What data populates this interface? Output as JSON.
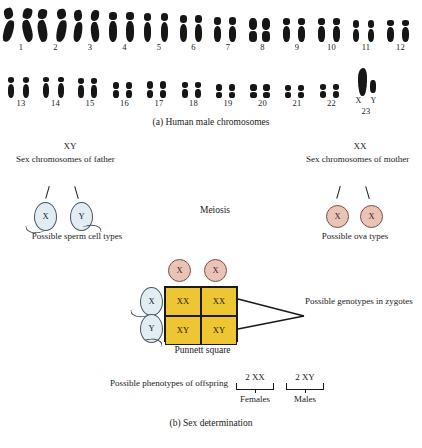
{
  "figure": {
    "caption_a": "(a) Human male chromosomes",
    "caption_b": "(b) Sex determination"
  },
  "karyotype": {
    "row1": [
      {
        "num": "1"
      },
      {
        "num": "2"
      },
      {
        "num": "3"
      },
      {
        "num": "4"
      },
      {
        "num": "5"
      },
      {
        "num": "6"
      },
      {
        "num": "7"
      },
      {
        "num": "8"
      },
      {
        "num": "9"
      },
      {
        "num": "10"
      },
      {
        "num": "11"
      },
      {
        "num": "12"
      }
    ],
    "row2": [
      {
        "num": "13"
      },
      {
        "num": "14"
      },
      {
        "num": "15"
      },
      {
        "num": "16"
      },
      {
        "num": "17"
      },
      {
        "num": "18"
      },
      {
        "num": "19"
      },
      {
        "num": "20"
      },
      {
        "num": "21"
      },
      {
        "num": "22"
      },
      {
        "num": "23"
      }
    ],
    "sex_pair": {
      "x_label": "X",
      "y_label": "Y"
    }
  },
  "father": {
    "genotype": "XY",
    "description": "Sex chromosomes of father",
    "gametes": [
      {
        "label": "X"
      },
      {
        "label": "Y"
      }
    ],
    "gamete_caption": "Possible sperm cell types"
  },
  "mother": {
    "genotype": "XX",
    "description": "Sex chromosomes of mother",
    "gametes": [
      {
        "label": "X"
      },
      {
        "label": "X"
      }
    ],
    "gamete_caption": "Possible ova types"
  },
  "meiosis_label": "Meiosis",
  "punnett": {
    "label": "Punnett square",
    "column_gametes": [
      {
        "label": "X"
      },
      {
        "label": "X"
      }
    ],
    "row_gametes": [
      {
        "label": "X"
      },
      {
        "label": "Y"
      }
    ],
    "cells": [
      {
        "genotype": "XX"
      },
      {
        "genotype": "XX"
      },
      {
        "genotype": "XY"
      },
      {
        "genotype": "XY"
      }
    ],
    "annotation": "Possible genotypes in zygotes",
    "fill_color": "#eec633"
  },
  "phenotypes": {
    "label": "Possible phenotypes of offspring",
    "groups": [
      {
        "genotype": "2 XX",
        "name": "Females"
      },
      {
        "genotype": "2 XY",
        "name": "Males"
      }
    ]
  },
  "colors": {
    "sperm": "#e2ecf3",
    "ovum": "#e9c4b6",
    "punnett": "#eec633",
    "chromosome": "#161616"
  }
}
